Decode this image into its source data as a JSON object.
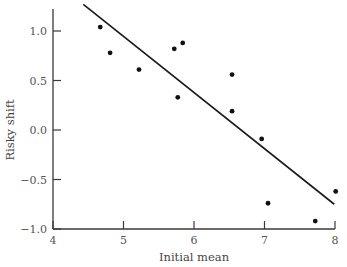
{
  "chart_data": {
    "type": "scatter",
    "title": "",
    "xlabel": "Initial mean",
    "ylabel": "Risky shift",
    "xlim": [
      4,
      8
    ],
    "ylim": [
      -1.0,
      1.25
    ],
    "xticks": [
      4,
      5,
      6,
      7,
      8
    ],
    "xtick_labels": [
      "4",
      "5",
      "6",
      "7",
      "8"
    ],
    "yticks": [
      1.0,
      0.5,
      0.0,
      -0.5,
      -1.0
    ],
    "ytick_labels": [
      "1.0",
      "0.5",
      "0.0",
      "−0.5",
      "−1.0"
    ],
    "grid": false,
    "legend": null,
    "series": [
      {
        "name": "observations",
        "kind": "scatter",
        "color": "#111111",
        "points": [
          {
            "x": 4.67,
            "y": 1.04
          },
          {
            "x": 4.81,
            "y": 0.78
          },
          {
            "x": 5.22,
            "y": 0.61
          },
          {
            "x": 5.72,
            "y": 0.82
          },
          {
            "x": 5.84,
            "y": 0.88
          },
          {
            "x": 5.77,
            "y": 0.33
          },
          {
            "x": 6.54,
            "y": 0.56
          },
          {
            "x": 6.54,
            "y": 0.19
          },
          {
            "x": 6.96,
            "y": -0.09
          },
          {
            "x": 7.05,
            "y": -0.74
          },
          {
            "x": 7.72,
            "y": -0.92
          },
          {
            "x": 8.01,
            "y": -0.62
          }
        ]
      },
      {
        "name": "regression line",
        "kind": "line",
        "color": "#1a1a1a",
        "points": [
          {
            "x": 4.43,
            "y": 1.27
          },
          {
            "x": 7.99,
            "y": -0.75
          }
        ]
      }
    ]
  },
  "layout": {
    "plot_left": 53,
    "plot_right": 335,
    "x_min_px": 53,
    "x_max_px": 335,
    "y_top_px": 31,
    "y_bottom_px": 229,
    "y_axis_top_px": 9
  }
}
